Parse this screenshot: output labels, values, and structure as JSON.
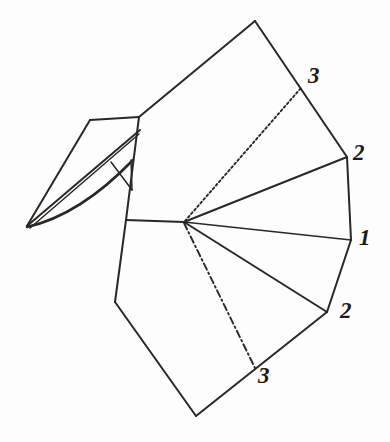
{
  "figure": {
    "background_color": "#fdfdfd",
    "ink_color": "#2a2724",
    "width": 390,
    "height": 442
  },
  "labels": [
    {
      "id": "label-3-upper",
      "text": "3",
      "x": 308,
      "y": 64
    },
    {
      "id": "label-2-upper",
      "text": "2",
      "x": 353,
      "y": 141
    },
    {
      "id": "label-1",
      "text": "1",
      "x": 359,
      "y": 226
    },
    {
      "id": "label-2-lower",
      "text": "2",
      "x": 340,
      "y": 299
    },
    {
      "id": "label-3-lower",
      "text": "3",
      "x": 258,
      "y": 364
    }
  ],
  "vertices": {
    "fan_apex": {
      "x": 184,
      "y": 222
    },
    "top_apex": {
      "x": 255,
      "y": 21
    },
    "crease_3_upper": {
      "x": 301,
      "y": 88
    },
    "vertex_2_upper": {
      "x": 347,
      "y": 157
    },
    "vertex_1_right": {
      "x": 351,
      "y": 240
    },
    "vertex_2_lower": {
      "x": 327,
      "y": 312
    },
    "crease_3_lower": {
      "x": 256,
      "y": 370
    },
    "bottom_apex": {
      "x": 196,
      "y": 416
    },
    "left_bottom": {
      "x": 115,
      "y": 302
    },
    "neck_lower": {
      "x": 126,
      "y": 220
    },
    "neck_upper": {
      "x": 139,
      "y": 117
    },
    "head_top_left": {
      "x": 90,
      "y": 120
    },
    "beak_tip": {
      "x": 27,
      "y": 226
    }
  },
  "strokes": {
    "top_panel_left_edge": "M 139,117 L 255,21",
    "top_panel_right_edge": "M 255,21 L 347,157",
    "crease_3_upper_line": "M 185,221 L 301,88",
    "fan_rib_2_upper": "M 184,222 L 347,157",
    "fan_rib_1": "M 184,222 L 351,240",
    "fan_rib_2_lower": "M 184,222 L 327,312",
    "crease_3_lower_line": "M 184,223 L 256,370",
    "right_edge_2_to_1": "M 347,157 L 351,240",
    "right_edge_1_to_2": "M 351,240 L 327,312",
    "lower_right_edge": "M 327,312 L 196,416",
    "bottom_left_edge": "M 196,416 L 115,302",
    "left_lower_edge": "M 115,302 L 126,220",
    "neck_vertical": "M 126,220 L 139,117",
    "apex_to_neck": "M 126,220 L 184,222",
    "head_top_edge": "M 90,120 L 139,117",
    "head_left_edge": "M 90,120 L 27,226",
    "beak_upper_fold": "M 27,226 L 140,130",
    "beak_inner_fold": "M 30,228 L 139,134",
    "beak_lower_curve": "M 27,227 Q 80,215 133,160",
    "beak_small_brace": "M 111,162 L 132,190",
    "beak_brace_lower": "M 132,190 L 131,160"
  }
}
